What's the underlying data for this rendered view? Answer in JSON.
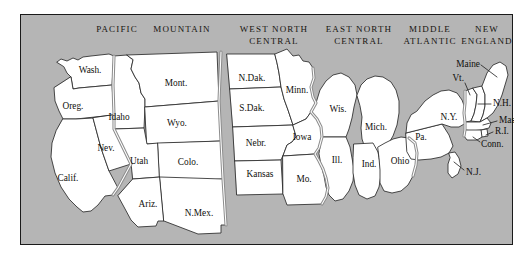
{
  "figure": {
    "kind": "map",
    "background_color": "#b5b5b5",
    "land_color": "#ffffff",
    "outline_color": "#2b2b2b",
    "division_boundary_color": "#8d8d8d",
    "frame_color": "#1a1a1a"
  },
  "divisions": [
    {
      "id": "pacific",
      "label": "PACIFIC",
      "x": 96,
      "y": 8
    },
    {
      "id": "mountain",
      "label": "MOUNTAIN",
      "x": 161,
      "y": 8
    },
    {
      "id": "west-north-central",
      "label": "WEST NORTH\nCENTRAL",
      "x": 253,
      "y": 8
    },
    {
      "id": "east-north-central",
      "label": "EAST NORTH\nCENTRAL",
      "x": 338,
      "y": 8
    },
    {
      "id": "middle-atlantic",
      "label": "MIDDLE\nATLANTIC",
      "x": 409,
      "y": 8
    },
    {
      "id": "new-england",
      "label": "NEW\nENGLAND",
      "x": 462,
      "y": 8
    }
  ],
  "states": [
    {
      "id": "washington",
      "label": "Wash.",
      "lx": 69,
      "ly": 56,
      "size": "normal",
      "leader": false
    },
    {
      "id": "oregon",
      "label": "Oreg.",
      "lx": 52,
      "ly": 92,
      "size": "normal",
      "leader": false
    },
    {
      "id": "california",
      "label": "Calif.",
      "lx": 47,
      "ly": 164,
      "size": "normal",
      "leader": false
    },
    {
      "id": "idaho",
      "label": "Idaho",
      "lx": 98,
      "ly": 103,
      "size": "normal",
      "leader": false
    },
    {
      "id": "nevada",
      "label": "Nev.",
      "lx": 85,
      "ly": 134,
      "size": "normal",
      "leader": false
    },
    {
      "id": "montana",
      "label": "Mont.",
      "lx": 155,
      "ly": 69,
      "size": "normal",
      "leader": false
    },
    {
      "id": "wyoming",
      "label": "Wyo.",
      "lx": 156,
      "ly": 109,
      "size": "normal",
      "leader": false
    },
    {
      "id": "utah",
      "label": "Utah",
      "lx": 118,
      "ly": 147,
      "size": "normal",
      "leader": false
    },
    {
      "id": "colorado",
      "label": "Colo.",
      "lx": 167,
      "ly": 148,
      "size": "normal",
      "leader": false
    },
    {
      "id": "arizona",
      "label": "Ariz.",
      "lx": 127,
      "ly": 190,
      "size": "normal",
      "leader": false
    },
    {
      "id": "new-mexico",
      "label": "N.Mex.",
      "lx": 178,
      "ly": 199,
      "size": "normal",
      "leader": false
    },
    {
      "id": "north-dakota",
      "label": "N.Dak.",
      "lx": 231,
      "ly": 64,
      "size": "normal",
      "leader": false
    },
    {
      "id": "south-dakota",
      "label": "S.Dak.",
      "lx": 231,
      "ly": 94,
      "size": "normal",
      "leader": false
    },
    {
      "id": "nebraska",
      "label": "Nebr.",
      "lx": 235,
      "ly": 129,
      "size": "normal",
      "leader": false
    },
    {
      "id": "kansas",
      "label": "Kansas",
      "lx": 239,
      "ly": 160,
      "size": "normal",
      "leader": false
    },
    {
      "id": "minnesota",
      "label": "Minn.",
      "lx": 276,
      "ly": 76,
      "size": "normal",
      "leader": false
    },
    {
      "id": "iowa",
      "label": "Iowa",
      "lx": 281,
      "ly": 123,
      "size": "normal",
      "leader": false
    },
    {
      "id": "missouri",
      "label": "Mo.",
      "lx": 283,
      "ly": 165,
      "size": "normal",
      "leader": false
    },
    {
      "id": "wisconsin",
      "label": "Wis.",
      "lx": 317,
      "ly": 95,
      "size": "normal",
      "leader": false
    },
    {
      "id": "illinois",
      "label": "Ill.",
      "lx": 316,
      "ly": 146,
      "size": "normal",
      "leader": false
    },
    {
      "id": "michigan",
      "label": "Mich.",
      "lx": 355,
      "ly": 113,
      "size": "normal",
      "leader": false
    },
    {
      "id": "indiana",
      "label": "Ind.",
      "lx": 348,
      "ly": 150,
      "size": "normal",
      "leader": false
    },
    {
      "id": "ohio",
      "label": "Ohio",
      "lx": 379,
      "ly": 147,
      "size": "normal",
      "leader": false
    },
    {
      "id": "pennsylvania",
      "label": "Pa.",
      "lx": 400,
      "ly": 123,
      "size": "normal",
      "leader": false
    },
    {
      "id": "new-york",
      "label": "N.Y.",
      "lx": 428,
      "ly": 103,
      "size": "normal",
      "leader": false
    },
    {
      "id": "maine",
      "label": "Maine",
      "lx": 455,
      "ly": 50,
      "size": "normal",
      "leader": true
    },
    {
      "id": "vermont",
      "label": "Vt.",
      "lx": 443,
      "ly": 66,
      "size": "normal",
      "leader": true
    },
    {
      "id": "new-hampshire",
      "label": "N.H.",
      "lx": 473,
      "ly": 89,
      "size": "normal",
      "leader": true
    },
    {
      "id": "massachusetts",
      "label": "Mass.",
      "lx": 478,
      "ly": 106,
      "size": "normal",
      "leader": true
    },
    {
      "id": "rhode-island",
      "label": "R.I.",
      "lx": 473,
      "ly": 120,
      "size": "normal",
      "leader": true
    },
    {
      "id": "connecticut",
      "label": "Conn.",
      "lx": 460,
      "ly": 131,
      "size": "normal",
      "leader": true
    },
    {
      "id": "new-jersey",
      "label": "N.J.",
      "lx": 446,
      "ly": 158,
      "size": "normal",
      "leader": true
    }
  ]
}
